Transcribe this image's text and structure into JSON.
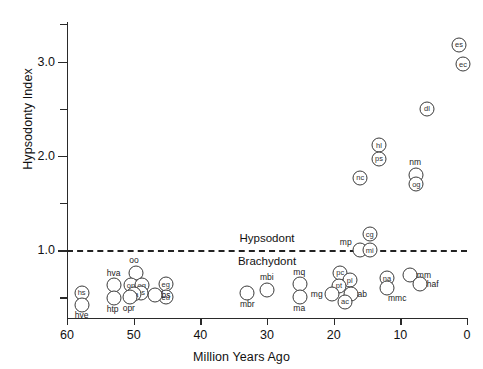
{
  "chart_data": {
    "type": "scatter",
    "title": "",
    "xlabel": "Million Years Ago",
    "ylabel": "Hypsodonty Index",
    "xlim": [
      60,
      0
    ],
    "ylim": [
      0.28,
      3.42
    ],
    "x_reversed": true,
    "grid": false,
    "legend": "none",
    "xticks": [
      60,
      50,
      40,
      30,
      20,
      10,
      0
    ],
    "xtick_labels": [
      "60",
      "50",
      "40",
      "30",
      "20",
      "10",
      "0"
    ],
    "yticks": [
      0.5,
      1.0,
      1.5,
      2.0,
      2.5,
      3.0,
      3.4
    ],
    "ytick_labels": [
      "",
      "1.0",
      "",
      "2.0",
      "",
      "3.0",
      ""
    ],
    "ytick_major": [
      1.0,
      2.0,
      3.0
    ],
    "reference_line": {
      "y": 1.0,
      "style": "dashed",
      "label_above": "Hypsodont",
      "label_below": "Brachydont",
      "label_x": 30
    },
    "point_marker": "open-circle-with-code",
    "points": [
      {
        "code": "es",
        "x": 1.2,
        "y": 3.18,
        "label_pos": "inside"
      },
      {
        "code": "ec",
        "x": 0.6,
        "y": 2.97,
        "label_pos": "inside"
      },
      {
        "code": "dl",
        "x": 6.0,
        "y": 2.5,
        "label_pos": "inside"
      },
      {
        "code": "hl",
        "x": 13.2,
        "y": 2.11,
        "label_pos": "inside"
      },
      {
        "code": "ps",
        "x": 13.2,
        "y": 1.97,
        "label_pos": "inside"
      },
      {
        "code": "nc",
        "x": 16.0,
        "y": 1.77,
        "label_pos": "inside"
      },
      {
        "code": "nm",
        "x": 7.6,
        "y": 1.8,
        "label_pos": "above"
      },
      {
        "code": "og",
        "x": 7.6,
        "y": 1.7,
        "label_pos": "inside"
      },
      {
        "code": "cg",
        "x": 14.6,
        "y": 1.17,
        "label_pos": "inside"
      },
      {
        "code": "mp",
        "x": 16.0,
        "y": 1.0,
        "label_pos": "above-left"
      },
      {
        "code": "mi",
        "x": 14.6,
        "y": 1.0,
        "label_pos": "inside"
      },
      {
        "code": "mm",
        "x": 8.5,
        "y": 0.74,
        "label_pos": "right"
      },
      {
        "code": "haf",
        "x": 7.0,
        "y": 0.64,
        "label_pos": "right"
      },
      {
        "code": "na",
        "x": 12.0,
        "y": 0.7,
        "label_pos": "inside"
      },
      {
        "code": "mmc",
        "x": 12.0,
        "y": 0.6,
        "label_pos": "below-right"
      },
      {
        "code": "pc",
        "x": 19.0,
        "y": 0.76,
        "label_pos": "inside"
      },
      {
        "code": "pl",
        "x": 17.6,
        "y": 0.68,
        "label_pos": "inside"
      },
      {
        "code": "pt",
        "x": 19.2,
        "y": 0.62,
        "label_pos": "inside"
      },
      {
        "code": "mg",
        "x": 20.2,
        "y": 0.53,
        "label_pos": "left"
      },
      {
        "code": "ab",
        "x": 17.4,
        "y": 0.53,
        "label_pos": "right"
      },
      {
        "code": "ac",
        "x": 18.3,
        "y": 0.45,
        "label_pos": "inside"
      },
      {
        "code": "mq",
        "x": 25.0,
        "y": 0.64,
        "label_pos": "above"
      },
      {
        "code": "ma",
        "x": 25.0,
        "y": 0.5,
        "label_pos": "below"
      },
      {
        "code": "mbi",
        "x": 30.0,
        "y": 0.58,
        "label_pos": "above"
      },
      {
        "code": "mbr",
        "x": 33.0,
        "y": 0.54,
        "label_pos": "below"
      },
      {
        "code": "eg",
        "x": 45.2,
        "y": 0.64,
        "label_pos": "inside"
      },
      {
        "code": "eu",
        "x": 45.2,
        "y": 0.5,
        "label_pos": "inside"
      },
      {
        "code": "bs",
        "x": 46.8,
        "y": 0.52,
        "label_pos": "right"
      },
      {
        "code": "oo",
        "x": 49.6,
        "y": 0.76,
        "label_pos": "above"
      },
      {
        "code": "op",
        "x": 50.4,
        "y": 0.63,
        "label_pos": "inside"
      },
      {
        "code": "oq",
        "x": 48.8,
        "y": 0.63,
        "label_pos": "inside"
      },
      {
        "code": "os",
        "x": 48.9,
        "y": 0.55,
        "label_pos": "inside"
      },
      {
        "code": "oa",
        "x": 49.9,
        "y": 0.53,
        "label_pos": "inside"
      },
      {
        "code": "opr",
        "x": 50.6,
        "y": 0.5,
        "label_pos": "below"
      },
      {
        "code": "hva",
        "x": 53.0,
        "y": 0.63,
        "label_pos": "above"
      },
      {
        "code": "htp",
        "x": 53.0,
        "y": 0.49,
        "label_pos": "below"
      },
      {
        "code": "hs",
        "x": 57.8,
        "y": 0.55,
        "label_pos": "inside"
      },
      {
        "code": "hve",
        "x": 57.8,
        "y": 0.42,
        "label_pos": "below"
      }
    ]
  }
}
